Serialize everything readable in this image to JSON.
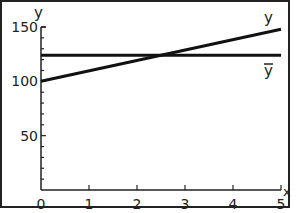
{
  "chart_data": {
    "type": "line",
    "title": "",
    "xlabel": "x",
    "ylabel": "y",
    "xlim": [
      0,
      5
    ],
    "ylim": [
      0,
      150
    ],
    "x_ticks": [
      0,
      1,
      2,
      3,
      4,
      5
    ],
    "y_ticks": [
      50,
      100,
      150
    ],
    "x_tick_labels": [
      "0",
      "1",
      "2",
      "3",
      "4",
      "5"
    ],
    "y_tick_labels": [
      "50",
      "100",
      "150"
    ],
    "grid": false,
    "legend": "inline labels at right end of lines",
    "series": [
      {
        "name": "y",
        "x": [
          0,
          5
        ],
        "values": [
          100,
          148
        ],
        "label": "y"
      },
      {
        "name": "ybar",
        "x": [
          0,
          5
        ],
        "values": [
          124,
          124
        ],
        "label": "ȳ"
      }
    ]
  },
  "labels": {
    "y_axis": "y",
    "x_axis": "x",
    "line_y": "y",
    "line_ybar": "y"
  }
}
